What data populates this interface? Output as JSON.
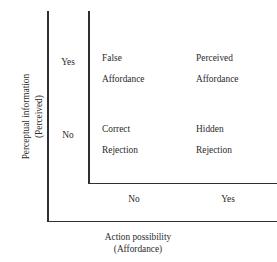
{
  "figure": {
    "cropped_title": "",
    "background_color": "#ffffff",
    "line_color": "#2f2f2f",
    "text_color": "#2b2b2b"
  },
  "axes": {
    "y": {
      "title_line1": "Perceptual information",
      "title_line2": "(Perceived)",
      "ticks": [
        {
          "label": "Yes"
        },
        {
          "label": "No"
        }
      ]
    },
    "x": {
      "title_line1": "Action possibility",
      "title_line2": "(Affordance)",
      "ticks": [
        {
          "label": "No"
        },
        {
          "label": "Yes"
        }
      ]
    }
  },
  "chart_data": {
    "type": "table",
    "title": "",
    "xlabel": "Action possibility (Affordance)",
    "ylabel": "Perceptual information (Perceived)",
    "x_categories": [
      "No",
      "Yes"
    ],
    "y_categories": [
      "Yes",
      "No"
    ],
    "grid": false,
    "legend": "none",
    "cells": [
      {
        "row": "Yes",
        "column": "No",
        "line1": "False",
        "line2": "Affordance",
        "text": "False Affordance"
      },
      {
        "row": "Yes",
        "column": "Yes",
        "line1": "Perceived",
        "line2": "Affordance",
        "text": "Perceived Affordance"
      },
      {
        "row": "No",
        "column": "No",
        "line1": "Correct",
        "line2": "Rejection",
        "text": "Correct Rejection"
      },
      {
        "row": "No",
        "column": "Yes",
        "line1": "Hidden",
        "line2": "Rejection",
        "text": "Hidden Rejection"
      }
    ]
  }
}
